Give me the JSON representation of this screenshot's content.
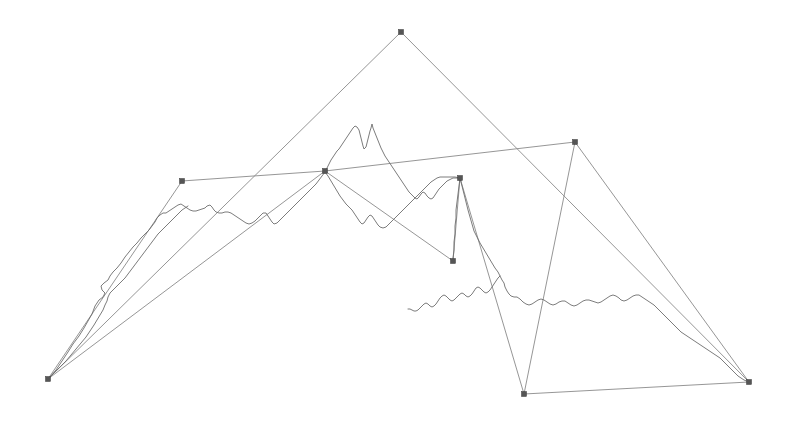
{
  "figure": {
    "title": "",
    "background_color": "#ffffff",
    "width": 790,
    "height": 425
  },
  "style": {
    "edge_color": "#8a8a8a",
    "coastline_color": "#6d6d6d",
    "vertex_fill": "#555555",
    "vertex_stroke": "#3a3a3a",
    "edge_width": 0.9,
    "coastline_width": 0.9,
    "vertex_size": 5
  },
  "chart_data": {
    "type": "scatter",
    "title": "",
    "xlabel": "",
    "ylabel": "",
    "xlim": [
      0,
      790
    ],
    "ylim": [
      0,
      425
    ],
    "grid": false,
    "legend": null,
    "annotations": [],
    "vertices": [
      {
        "id": "v0",
        "label": "bottom-left-node",
        "x": 48,
        "y": 379
      },
      {
        "id": "v1",
        "label": "left-node",
        "x": 182,
        "y": 181
      },
      {
        "id": "v2",
        "label": "apex-node",
        "x": 401,
        "y": 32
      },
      {
        "id": "v3",
        "label": "center-left-node",
        "x": 325,
        "y": 171
      },
      {
        "id": "v4",
        "label": "center-right-node",
        "x": 460,
        "y": 178
      },
      {
        "id": "v5",
        "label": "center-lower-node",
        "x": 453,
        "y": 261
      },
      {
        "id": "v6",
        "label": "top-right-node",
        "x": 575,
        "y": 142
      },
      {
        "id": "v7",
        "label": "bottom-mid-node",
        "x": 524,
        "y": 394
      },
      {
        "id": "v8",
        "label": "right-node",
        "x": 749,
        "y": 382
      }
    ],
    "edges": [
      {
        "from": "v0",
        "to": "v1"
      },
      {
        "from": "v0",
        "to": "v2"
      },
      {
        "from": "v0",
        "to": "v3"
      },
      {
        "from": "v1",
        "to": "v3"
      },
      {
        "from": "v3",
        "to": "v6"
      },
      {
        "from": "v2",
        "to": "v8"
      },
      {
        "from": "v6",
        "to": "v8"
      },
      {
        "from": "v3",
        "to": "v5"
      },
      {
        "from": "v4",
        "to": "v5"
      },
      {
        "from": "v4",
        "to": "v7"
      },
      {
        "from": "v7",
        "to": "v8"
      },
      {
        "from": "v6",
        "to": "v7"
      }
    ],
    "coastline_paths": [
      {
        "name": "west-coast-to-center",
        "points": "48,379 56,370 62,361 68,352 73,344 79,336 84,328 88,321 92,314 95,306 99,300 103,297 105,293 102,290 101,286 104,283 108,280 110,276 113,272 117,268 121,263 125,257 129,252 133,247 137,243 141,238 145,234 149,230 152,226 155,222 157,218 160,215 163,213 166,213 169,211 172,209 175,207 178,205 181,204 184,206 187,208 190,210 193,211 196,211 199,210 202,209 205,208 207,206 210,205 212,207 214,210 216,212 219,213 222,213 225,212 228,212 231,213 234,215 237,217 240,219 243,221 246,223 249,224 252,223 255,221 257,219 259,217 261,215 263,213 266,213 268,216 270,219 272,222 274,224 277,223 280,220 283,217 286,214 289,211 292,208 295,205 298,202 301,199 304,196 307,193 310,190 313,187 316,184 319,180 322,176 325,172"
      },
      {
        "name": "center-peninsula",
        "points": "325,172 327,168 329,164 331,160 333,157 335,154 337,151 339,149 341,146 343,143 345,140 347,137 349,134 351,131 353,128 355,126 357,127 359,130 360,134 361,138 362,142 363,146 364,149 366,147 367,143 368,139 369,135 370,131 371,128 372,124 373,128 375,133 377,138 379,143 381,148 383,152 385,156 387,159 389,162 391,165 393,168 395,171 397,174 399,177 401,180 403,183 405,186 407,189 409,192 411,194 413,196 415,198 417,199 419,197 421,194 423,192 425,193 427,196 429,198 431,199 433,198 435,195 437,192 439,189 441,187 443,185 445,183 447,181 449,180 451,179 453,178 456,178 460,178"
      },
      {
        "name": "center-inner-loop",
        "points": "325,172 328,176 331,181 334,186 337,191 340,196 343,200 346,204 349,207 352,210 354,213 356,216 358,219 360,222 362,224 364,223 366,220 368,217 370,215 372,216 374,219 376,222 378,225 380,227 383,228 386,227 389,224 392,221 395,218 398,215 401,212 404,209 407,206 410,203 413,200 416,197 419,194 422,191 425,188 428,185 431,182 434,180 437,178 440,177 443,177 446,177 450,177 455,177 460,178"
      },
      {
        "name": "center-spur",
        "points": "460,178 459,186 458,194 457,202 456,210 456,218 455,226 455,234 454,242 454,250 453,258 453,261"
      },
      {
        "name": "east-coast",
        "points": "460,178 462,186 464,194 466,202 468,210 470,217 472,224 474,231 477,237 480,243 483,248 486,253 489,258 492,263 495,268 498,272 500,276 502,280 504,283 505,287 507,291 509,294 511,296 514,297 517,297 520,299 523,302 526,304 529,305 532,304 535,302 538,300 541,299 544,300 547,302 550,304 553,305 556,304 559,302 562,301 565,301 568,303 571,305 574,306 577,305 580,303 583,301 586,300 589,300 592,301 595,302 598,303 601,302 604,300 607,298 610,296 613,295 616,296 619,298 621,300 624,301 627,300 630,298 633,296 636,295 639,295 642,297 645,299 648,301 651,303 654,305 657,308 660,311 663,314 666,317 669,320 672,323 675,326 678,329 681,332 684,334 687,336 690,338 693,340 696,342 699,344 702,346 705,348 708,350 711,352 714,354 717,356 720,358 723,361 726,364 729,367 732,370 735,373 738,376 741,378 744,380 749,382"
      },
      {
        "name": "southwest-inlet",
        "points": "500,276 498,278 496,281 494,284 492,287 490,290 488,292 486,293 484,292 482,290 480,288 478,287 476,288 474,291 472,294 470,296 468,297 466,296 464,294 462,293 460,294 458,296 456,298 454,300 452,301 450,300 448,298 446,296 444,295 442,296 440,298 438,301 436,304 434,306 432,307 430,306 428,304 426,303 424,304 422,306 420,308 418,310 416,311 414,311 412,310 410,309 408,309"
      },
      {
        "name": "west-inner-shore",
        "points": "48,379 54,373 60,367 66,361 71,355 76,349 81,343 86,337 90,331 94,325 97,320 100,315 103,310 105,305 107,301 108,297 110,293 113,290 116,287 119,284 122,281 125,278 128,274 131,270 134,266 137,262 140,258 143,254 146,250 149,246 152,242 155,238 158,234 161,231 164,228 167,225 170,222 173,219 176,216 179,213 182,210 185,208 188,206"
      }
    ]
  }
}
